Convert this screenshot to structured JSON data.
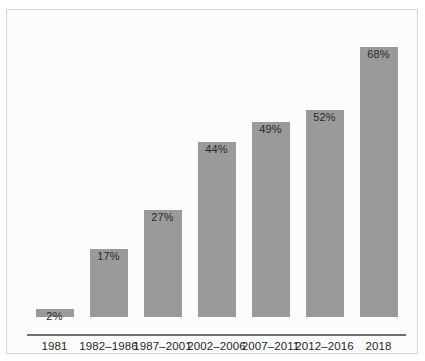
{
  "figure": {
    "top_cutoff_text": "",
    "bar_color": "#9a9a9a",
    "background_color": "#fcfcfc",
    "frame_border_color": "#d8d8d8",
    "axis_color": "#6f6f6f",
    "label_color": "#1f1f1f"
  },
  "chart_data": {
    "type": "bar",
    "title": "",
    "xlabel": "",
    "ylabel": "",
    "categories": [
      "1981",
      "1982–1986",
      "1987–2001",
      "2002–2006",
      "2007–2011",
      "2012–2016",
      "2018"
    ],
    "values": [
      2,
      17,
      27,
      44,
      49,
      52,
      68
    ],
    "value_labels": [
      "2%",
      "17%",
      "27%",
      "44%",
      "49%",
      "52%",
      "68%"
    ],
    "ylim": [
      0,
      72
    ],
    "grid": false,
    "legend": null,
    "orientation": "vertical"
  }
}
